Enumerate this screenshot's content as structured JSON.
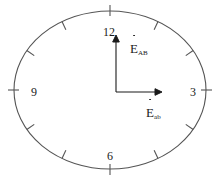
{
  "figure": {
    "type": "clock-face-vector-diagram",
    "background_color": "#ffffff",
    "stroke_color": "#555555",
    "text_color": "#1a1a1a"
  },
  "clock": {
    "ellipse": {
      "center_x": 110,
      "center_y": 90,
      "radius_x": 96,
      "radius_y": 79
    },
    "hour_numbers": [
      {
        "label": "12",
        "hour": 12,
        "x": 103,
        "y": 26
      },
      {
        "label": "3",
        "hour": 3,
        "x": 190,
        "y": 86
      },
      {
        "label": "6",
        "hour": 6,
        "x": 107,
        "y": 150
      },
      {
        "label": "9",
        "hour": 9,
        "x": 31,
        "y": 86
      }
    ],
    "tick_count": 12
  },
  "vectors": [
    {
      "name": "vertical-vector",
      "symbol": "E",
      "subscript": "AB",
      "accent": "dot",
      "direction": "up",
      "origin_x": 116,
      "origin_y": 92,
      "tip_x": 116,
      "tip_y": 36,
      "label_x": 130,
      "label_y": 40
    },
    {
      "name": "horizontal-vector",
      "symbol": "E",
      "subscript": "ab",
      "accent": "dot",
      "direction": "right",
      "origin_x": 116,
      "origin_y": 92,
      "tip_x": 162,
      "tip_y": 92,
      "label_x": 146,
      "label_y": 104
    }
  ]
}
